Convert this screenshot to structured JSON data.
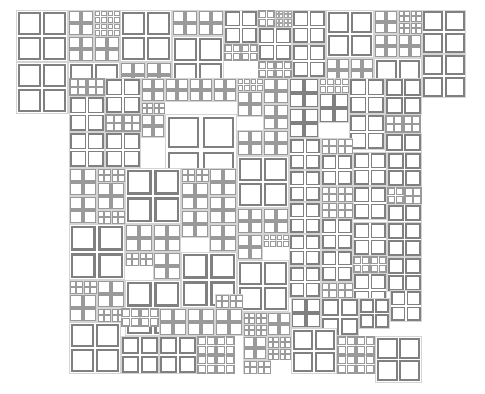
{
  "canvas": {
    "width": 485,
    "height": 394,
    "background_color": "#ffffff",
    "title": "Recursive Cross Tiling"
  },
  "style": {
    "cell_border_color": "#c9c9c9",
    "cell_border_width": 0.8,
    "cross_stroke_color": "#808080",
    "cross_stroke_width": 2.0,
    "cross_stroke_color_light": "#9a9a9a",
    "fill_color": "#ffffff",
    "gap_ratio": 0.085,
    "arm_ratio": 0.5
  },
  "regions": [
    {
      "name": "top-band",
      "x": 16,
      "y": 10,
      "width": 450,
      "height": 68
    },
    {
      "name": "main-body",
      "x": 69,
      "y": 78,
      "width": 353,
      "height": 296
    }
  ],
  "chart_data": {
    "type": "table",
    "cells": [
      {
        "x": 16,
        "y": 10,
        "s": 52,
        "w": 2.2
      },
      {
        "x": 68,
        "y": 10,
        "s": 26,
        "w": 1.3
      },
      {
        "x": 94,
        "y": 10,
        "s": 13,
        "w": 1.0
      },
      {
        "x": 107,
        "y": 10,
        "s": 13,
        "w": 1.0
      },
      {
        "x": 94,
        "y": 23,
        "s": 13,
        "w": 1.0
      },
      {
        "x": 107,
        "y": 23,
        "s": 13,
        "w": 1.0
      },
      {
        "x": 68,
        "y": 36,
        "s": 26,
        "w": 1.3
      },
      {
        "x": 94,
        "y": 36,
        "s": 26,
        "w": 1.3
      },
      {
        "x": 16,
        "y": 62,
        "s": 52,
        "w": 2.2
      },
      {
        "x": 68,
        "y": 62,
        "s": 52,
        "w": 2.2
      },
      {
        "x": 120,
        "y": 10,
        "s": 52,
        "w": 2.2
      },
      {
        "x": 172,
        "y": 10,
        "s": 26,
        "w": 1.3
      },
      {
        "x": 198,
        "y": 10,
        "s": 26,
        "w": 1.3
      },
      {
        "x": 172,
        "y": 36,
        "s": 52,
        "w": 2.2
      },
      {
        "x": 120,
        "y": 62,
        "s": 26,
        "w": 1.3
      },
      {
        "x": 146,
        "y": 62,
        "s": 26,
        "w": 1.3
      },
      {
        "x": 224,
        "y": 10,
        "s": 34,
        "w": 1.7
      },
      {
        "x": 224,
        "y": 44,
        "s": 17,
        "w": 1.1
      },
      {
        "x": 241,
        "y": 44,
        "s": 17,
        "w": 1.1
      },
      {
        "x": 258,
        "y": 10,
        "s": 17,
        "w": 1.1
      },
      {
        "x": 275,
        "y": 10,
        "s": 8.5,
        "w": 0.9
      },
      {
        "x": 283.5,
        "y": 10,
        "s": 8.5,
        "w": 0.9
      },
      {
        "x": 275,
        "y": 18.5,
        "s": 8.5,
        "w": 0.9
      },
      {
        "x": 283.5,
        "y": 18.5,
        "s": 8.5,
        "w": 0.9
      },
      {
        "x": 258,
        "y": 27,
        "s": 34,
        "w": 1.7
      },
      {
        "x": 292,
        "y": 10,
        "s": 34,
        "w": 1.7
      },
      {
        "x": 292,
        "y": 44,
        "s": 34,
        "w": 1.7
      },
      {
        "x": 258,
        "y": 61,
        "s": 17,
        "w": 1.1
      },
      {
        "x": 275,
        "y": 61,
        "s": 17,
        "w": 1.1
      },
      {
        "x": 326,
        "y": 10,
        "s": 48,
        "w": 2.1
      },
      {
        "x": 374,
        "y": 10,
        "s": 24,
        "w": 1.3
      },
      {
        "x": 398,
        "y": 10,
        "s": 12,
        "w": 1.0
      },
      {
        "x": 410,
        "y": 10,
        "s": 12,
        "w": 1.0
      },
      {
        "x": 398,
        "y": 22,
        "s": 12,
        "w": 1.0
      },
      {
        "x": 410,
        "y": 22,
        "s": 12,
        "w": 1.0
      },
      {
        "x": 374,
        "y": 34,
        "s": 24,
        "w": 1.3
      },
      {
        "x": 398,
        "y": 34,
        "s": 24,
        "w": 1.3
      },
      {
        "x": 326,
        "y": 58,
        "s": 24,
        "w": 1.3
      },
      {
        "x": 350,
        "y": 58,
        "s": 24,
        "w": 1.3
      },
      {
        "x": 374,
        "y": 58,
        "s": 48,
        "w": 2.1
      },
      {
        "x": 422,
        "y": 10,
        "s": 44,
        "w": 2.0
      },
      {
        "x": 422,
        "y": 54,
        "s": 44,
        "w": 2.0
      },
      {
        "x": 69,
        "y": 78,
        "s": 18,
        "w": 1.1
      },
      {
        "x": 87,
        "y": 78,
        "s": 18,
        "w": 1.1
      },
      {
        "x": 69,
        "y": 96,
        "s": 36,
        "w": 1.8
      },
      {
        "x": 105,
        "y": 78,
        "s": 36,
        "w": 1.8
      },
      {
        "x": 105,
        "y": 114,
        "s": 18,
        "w": 1.1
      },
      {
        "x": 123,
        "y": 114,
        "s": 18,
        "w": 1.1
      },
      {
        "x": 69,
        "y": 132,
        "s": 36,
        "w": 1.8
      },
      {
        "x": 105,
        "y": 132,
        "s": 36,
        "w": 1.8
      },
      {
        "x": 141,
        "y": 78,
        "s": 24,
        "w": 1.3
      },
      {
        "x": 141,
        "y": 102,
        "s": 12,
        "w": 1.0
      },
      {
        "x": 153,
        "y": 102,
        "s": 12,
        "w": 1.0
      },
      {
        "x": 165,
        "y": 78,
        "s": 24,
        "w": 1.3
      },
      {
        "x": 189,
        "y": 78,
        "s": 24,
        "w": 1.3
      },
      {
        "x": 141,
        "y": 114,
        "s": 24,
        "w": 1.3
      },
      {
        "x": 165,
        "y": 114,
        "s": 72,
        "w": 2.6
      },
      {
        "x": 213,
        "y": 78,
        "s": 24,
        "w": 1.3
      },
      {
        "x": 237,
        "y": 78,
        "s": 13,
        "w": 1.0
      },
      {
        "x": 250,
        "y": 78,
        "s": 13,
        "w": 1.0
      },
      {
        "x": 237,
        "y": 91,
        "s": 26,
        "w": 1.4
      },
      {
        "x": 263,
        "y": 78,
        "s": 26,
        "w": 1.4
      },
      {
        "x": 263,
        "y": 104,
        "s": 26,
        "w": 1.4
      },
      {
        "x": 289,
        "y": 78,
        "s": 30,
        "w": 1.6
      },
      {
        "x": 319,
        "y": 78,
        "s": 15,
        "w": 1.0
      },
      {
        "x": 334,
        "y": 78,
        "s": 15,
        "w": 1.0
      },
      {
        "x": 319,
        "y": 93,
        "s": 30,
        "w": 1.6
      },
      {
        "x": 289,
        "y": 108,
        "s": 30,
        "w": 1.6
      },
      {
        "x": 349,
        "y": 78,
        "s": 36,
        "w": 1.8
      },
      {
        "x": 385,
        "y": 78,
        "s": 37,
        "w": 1.8
      },
      {
        "x": 349,
        "y": 114,
        "s": 36,
        "w": 1.8
      },
      {
        "x": 385,
        "y": 115,
        "s": 18,
        "w": 1.1
      },
      {
        "x": 403,
        "y": 115,
        "s": 18,
        "w": 1.1
      },
      {
        "x": 385,
        "y": 133,
        "s": 37,
        "w": 1.8
      },
      {
        "x": 69,
        "y": 168,
        "s": 28,
        "w": 1.5
      },
      {
        "x": 97,
        "y": 168,
        "s": 14,
        "w": 1.0
      },
      {
        "x": 111,
        "y": 168,
        "s": 14,
        "w": 1.0
      },
      {
        "x": 97,
        "y": 182,
        "s": 28,
        "w": 1.5
      },
      {
        "x": 69,
        "y": 196,
        "s": 28,
        "w": 1.5
      },
      {
        "x": 97,
        "y": 210,
        "s": 14,
        "w": 1.0
      },
      {
        "x": 111,
        "y": 210,
        "s": 14,
        "w": 1.0
      },
      {
        "x": 125,
        "y": 168,
        "s": 56,
        "w": 2.3
      },
      {
        "x": 181,
        "y": 168,
        "s": 14,
        "w": 1.0
      },
      {
        "x": 195,
        "y": 168,
        "s": 14,
        "w": 1.0
      },
      {
        "x": 181,
        "y": 182,
        "s": 28,
        "w": 1.5
      },
      {
        "x": 209,
        "y": 168,
        "s": 28,
        "w": 1.5
      },
      {
        "x": 209,
        "y": 196,
        "s": 28,
        "w": 1.5
      },
      {
        "x": 237,
        "y": 130,
        "s": 26,
        "w": 1.4
      },
      {
        "x": 263,
        "y": 130,
        "s": 26,
        "w": 1.4
      },
      {
        "x": 237,
        "y": 156,
        "s": 52,
        "w": 2.2
      },
      {
        "x": 289,
        "y": 138,
        "s": 32,
        "w": 1.6
      },
      {
        "x": 321,
        "y": 138,
        "s": 16,
        "w": 1.0
      },
      {
        "x": 337,
        "y": 138,
        "s": 16,
        "w": 1.0
      },
      {
        "x": 321,
        "y": 154,
        "s": 32,
        "w": 1.6
      },
      {
        "x": 289,
        "y": 170,
        "s": 32,
        "w": 1.6
      },
      {
        "x": 321,
        "y": 186,
        "s": 16,
        "w": 1.0
      },
      {
        "x": 337,
        "y": 186,
        "s": 16,
        "w": 1.0
      },
      {
        "x": 353,
        "y": 152,
        "s": 34,
        "w": 1.7
      },
      {
        "x": 387,
        "y": 152,
        "s": 35,
        "w": 1.7
      },
      {
        "x": 353,
        "y": 186,
        "s": 34,
        "w": 1.7
      },
      {
        "x": 387,
        "y": 187,
        "s": 17,
        "w": 1.1
      },
      {
        "x": 404,
        "y": 187,
        "s": 18,
        "w": 1.1
      },
      {
        "x": 387,
        "y": 204,
        "s": 35,
        "w": 1.7
      },
      {
        "x": 69,
        "y": 224,
        "s": 56,
        "w": 2.3
      },
      {
        "x": 125,
        "y": 224,
        "s": 28,
        "w": 1.5
      },
      {
        "x": 153,
        "y": 224,
        "s": 28,
        "w": 1.5
      },
      {
        "x": 125,
        "y": 252,
        "s": 14,
        "w": 1.0
      },
      {
        "x": 139,
        "y": 252,
        "s": 14,
        "w": 1.0
      },
      {
        "x": 153,
        "y": 252,
        "s": 28,
        "w": 1.5
      },
      {
        "x": 69,
        "y": 280,
        "s": 14,
        "w": 1.0
      },
      {
        "x": 83,
        "y": 280,
        "s": 14,
        "w": 1.0
      },
      {
        "x": 69,
        "y": 294,
        "s": 28,
        "w": 1.5
      },
      {
        "x": 97,
        "y": 280,
        "s": 28,
        "w": 1.5
      },
      {
        "x": 97,
        "y": 308,
        "s": 14,
        "w": 1.0
      },
      {
        "x": 111,
        "y": 308,
        "s": 14,
        "w": 1.0
      },
      {
        "x": 181,
        "y": 210,
        "s": 28,
        "w": 1.5
      },
      {
        "x": 209,
        "y": 224,
        "s": 28,
        "w": 1.5
      },
      {
        "x": 237,
        "y": 208,
        "s": 26,
        "w": 1.4
      },
      {
        "x": 263,
        "y": 208,
        "s": 26,
        "w": 1.4
      },
      {
        "x": 237,
        "y": 234,
        "s": 26,
        "w": 1.4
      },
      {
        "x": 263,
        "y": 234,
        "s": 13,
        "w": 1.0
      },
      {
        "x": 276,
        "y": 234,
        "s": 13,
        "w": 1.0
      },
      {
        "x": 289,
        "y": 202,
        "s": 32,
        "w": 1.6
      },
      {
        "x": 321,
        "y": 202,
        "s": 16,
        "w": 1.0
      },
      {
        "x": 337,
        "y": 202,
        "s": 16,
        "w": 1.0
      },
      {
        "x": 321,
        "y": 218,
        "s": 32,
        "w": 1.6
      },
      {
        "x": 289,
        "y": 234,
        "s": 32,
        "w": 1.6
      },
      {
        "x": 353,
        "y": 222,
        "s": 34,
        "w": 1.7
      },
      {
        "x": 387,
        "y": 222,
        "s": 35,
        "w": 1.7
      },
      {
        "x": 353,
        "y": 256,
        "s": 17,
        "w": 1.1
      },
      {
        "x": 370,
        "y": 256,
        "s": 17,
        "w": 1.1
      },
      {
        "x": 353,
        "y": 273,
        "s": 34,
        "w": 1.7
      },
      {
        "x": 387,
        "y": 257,
        "s": 35,
        "w": 1.7
      },
      {
        "x": 125,
        "y": 280,
        "s": 56,
        "w": 2.3
      },
      {
        "x": 181,
        "y": 252,
        "s": 56,
        "w": 2.3
      },
      {
        "x": 237,
        "y": 260,
        "s": 52,
        "w": 2.2
      },
      {
        "x": 289,
        "y": 266,
        "s": 32,
        "w": 1.6
      },
      {
        "x": 321,
        "y": 250,
        "s": 32,
        "w": 1.6
      },
      {
        "x": 321,
        "y": 282,
        "s": 16,
        "w": 1.0
      },
      {
        "x": 337,
        "y": 282,
        "s": 16,
        "w": 1.0
      },
      {
        "x": 69,
        "y": 322,
        "s": 52,
        "w": 2.2
      },
      {
        "x": 121,
        "y": 336,
        "s": 38,
        "w": 1.8
      },
      {
        "x": 159,
        "y": 336,
        "s": 38,
        "w": 1.8
      },
      {
        "x": 121,
        "y": 308,
        "s": 19,
        "w": 1.1
      },
      {
        "x": 140,
        "y": 308,
        "s": 19,
        "w": 1.1
      },
      {
        "x": 159,
        "y": 308,
        "s": 28,
        "w": 1.5
      },
      {
        "x": 187,
        "y": 308,
        "s": 28,
        "w": 1.5
      },
      {
        "x": 197,
        "y": 336,
        "s": 19,
        "w": 1.1
      },
      {
        "x": 216,
        "y": 336,
        "s": 19,
        "w": 1.1
      },
      {
        "x": 197,
        "y": 355,
        "s": 19,
        "w": 1.1
      },
      {
        "x": 216,
        "y": 355,
        "s": 19,
        "w": 1.1
      },
      {
        "x": 215,
        "y": 294,
        "s": 14,
        "w": 1.0
      },
      {
        "x": 229,
        "y": 294,
        "s": 14,
        "w": 1.0
      },
      {
        "x": 215,
        "y": 308,
        "s": 28,
        "w": 1.5
      },
      {
        "x": 243,
        "y": 312,
        "s": 12,
        "w": 1.0
      },
      {
        "x": 255,
        "y": 312,
        "s": 12,
        "w": 1.0
      },
      {
        "x": 243,
        "y": 324,
        "s": 12,
        "w": 1.0
      },
      {
        "x": 255,
        "y": 324,
        "s": 12,
        "w": 1.0
      },
      {
        "x": 243,
        "y": 336,
        "s": 24,
        "w": 1.3
      },
      {
        "x": 267,
        "y": 312,
        "s": 24,
        "w": 1.3
      },
      {
        "x": 267,
        "y": 336,
        "s": 12,
        "w": 1.0
      },
      {
        "x": 279,
        "y": 336,
        "s": 12,
        "w": 1.0
      },
      {
        "x": 267,
        "y": 348,
        "s": 12,
        "w": 1.0
      },
      {
        "x": 279,
        "y": 348,
        "s": 12,
        "w": 1.0
      },
      {
        "x": 243,
        "y": 360,
        "s": 14,
        "w": 1.0
      },
      {
        "x": 257,
        "y": 360,
        "s": 14,
        "w": 1.0
      },
      {
        "x": 291,
        "y": 298,
        "s": 30,
        "w": 1.6
      },
      {
        "x": 321,
        "y": 298,
        "s": 38,
        "w": 1.8
      },
      {
        "x": 291,
        "y": 328,
        "s": 46,
        "w": 2.0
      },
      {
        "x": 337,
        "y": 336,
        "s": 19,
        "w": 1.1
      },
      {
        "x": 356,
        "y": 336,
        "s": 19,
        "w": 1.1
      },
      {
        "x": 337,
        "y": 355,
        "s": 19,
        "w": 1.1
      },
      {
        "x": 356,
        "y": 355,
        "s": 19,
        "w": 1.1
      },
      {
        "x": 359,
        "y": 298,
        "s": 31,
        "w": 1.6
      },
      {
        "x": 375,
        "y": 336,
        "s": 47,
        "w": 2.0
      },
      {
        "x": 390,
        "y": 290,
        "s": 32,
        "w": 1.6
      },
      {
        "x": 69,
        "y": 78,
        "s": 0,
        "w": 0
      }
    ]
  }
}
